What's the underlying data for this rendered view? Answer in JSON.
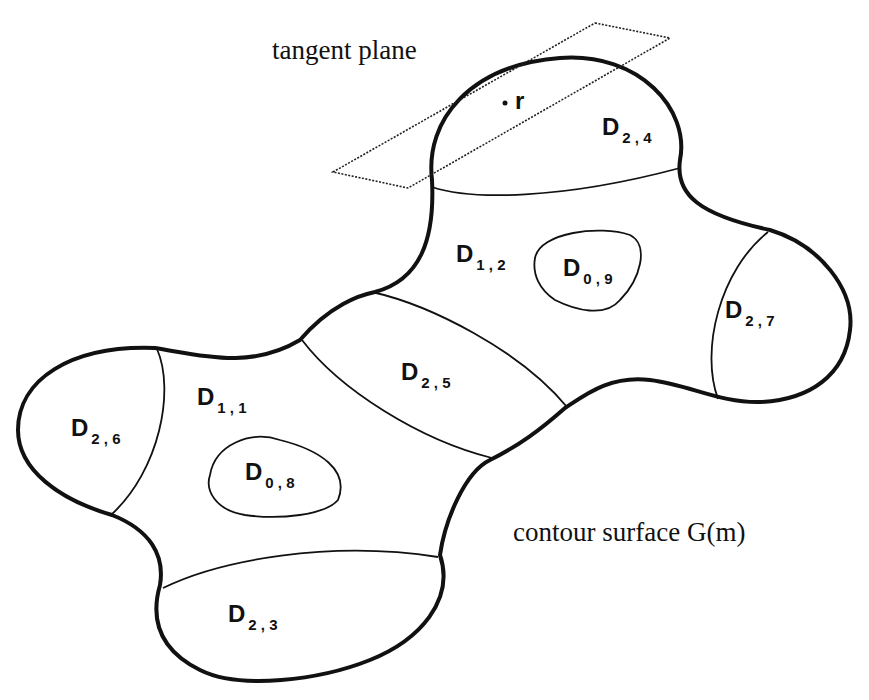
{
  "annotations": {
    "tangent_plane": "tangent plane",
    "contour_surface": "contour surface G(m)",
    "point": "r"
  },
  "regions": [
    {
      "id": "D24",
      "main": "D",
      "sub": "2 , 4"
    },
    {
      "id": "D12",
      "main": "D",
      "sub": "1 , 2"
    },
    {
      "id": "D09",
      "main": "D",
      "sub": "0 , 9"
    },
    {
      "id": "D27",
      "main": "D",
      "sub": "2 , 7"
    },
    {
      "id": "D25",
      "main": "D",
      "sub": "2 , 5"
    },
    {
      "id": "D11",
      "main": "D",
      "sub": "1 , 1"
    },
    {
      "id": "D26",
      "main": "D",
      "sub": "2 , 6"
    },
    {
      "id": "D08",
      "main": "D",
      "sub": "0 , 8"
    },
    {
      "id": "D23",
      "main": "D",
      "sub": "2 , 3"
    }
  ],
  "colors": {
    "stroke": "#111111",
    "background": "#ffffff"
  }
}
